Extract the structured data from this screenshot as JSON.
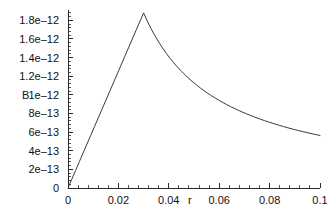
{
  "chart_data": {
    "type": "line",
    "title": "",
    "subtitle": "",
    "xlabel": "r",
    "ylabel": "B",
    "grid": false,
    "legend": null,
    "xlim": [
      0,
      0.1
    ],
    "ylim": [
      0,
      1.9e-12
    ],
    "x_ticks": [
      {
        "value": 0,
        "label": "0"
      },
      {
        "value": 0.02,
        "label": "0.02"
      },
      {
        "value": 0.04,
        "label": "0.04"
      },
      {
        "value": 0.06,
        "label": "0.06"
      },
      {
        "value": 0.08,
        "label": "0.08"
      },
      {
        "value": 0.1,
        "label": "0.1"
      }
    ],
    "y_ticks": [
      {
        "value": 0,
        "label": "0"
      },
      {
        "value": 2e-13,
        "label": "2e–13"
      },
      {
        "value": 4e-13,
        "label": "4e–13"
      },
      {
        "value": 6e-13,
        "label": "6e–13"
      },
      {
        "value": 8e-13,
        "label": "8e–13"
      },
      {
        "value": 1e-12,
        "label": "1e–12"
      },
      {
        "value": 1.2e-12,
        "label": "1.2e–12"
      },
      {
        "value": 1.4e-12,
        "label": "1.4e–12"
      },
      {
        "value": 1.6e-12,
        "label": "1.6e–12"
      },
      {
        "value": 1.8e-12,
        "label": "1.8e–12"
      }
    ],
    "x_minor_ticks_per_interval": 4,
    "y_minor_ticks_per_interval": 4,
    "peak": {
      "x": 0.03,
      "y": 1.88e-12
    },
    "series": [
      {
        "name": "B(r)",
        "color": "#3a3a3a",
        "points": [
          [
            0.0,
            0.0
          ],
          [
            0.0015,
            9.4e-14
          ],
          [
            0.003,
            1.88e-13
          ],
          [
            0.0045,
            2.82e-13
          ],
          [
            0.006,
            3.76e-13
          ],
          [
            0.0075,
            4.7e-13
          ],
          [
            0.009,
            5.64e-13
          ],
          [
            0.0105,
            6.58e-13
          ],
          [
            0.012,
            7.52e-13
          ],
          [
            0.0135,
            8.46e-13
          ],
          [
            0.015,
            9.4e-13
          ],
          [
            0.0165,
            1.034e-12
          ],
          [
            0.018,
            1.128e-12
          ],
          [
            0.0195,
            1.222e-12
          ],
          [
            0.021,
            1.316e-12
          ],
          [
            0.0225,
            1.41e-12
          ],
          [
            0.024,
            1.504e-12
          ],
          [
            0.0255,
            1.598e-12
          ],
          [
            0.027,
            1.692e-12
          ],
          [
            0.0285,
            1.786e-12
          ],
          [
            0.03,
            1.88e-12
          ],
          [
            0.0315,
            1.79e-12
          ],
          [
            0.033,
            1.709e-12
          ],
          [
            0.0345,
            1.635e-12
          ],
          [
            0.036,
            1.567e-12
          ],
          [
            0.0375,
            1.504e-12
          ],
          [
            0.039,
            1.446e-12
          ],
          [
            0.0405,
            1.392e-12
          ],
          [
            0.042,
            1.343e-12
          ],
          [
            0.0435,
            1.297e-12
          ],
          [
            0.045,
            1.253e-12
          ],
          [
            0.0465,
            1.213e-12
          ],
          [
            0.048,
            1.175e-12
          ],
          [
            0.0495,
            1.139e-12
          ],
          [
            0.051,
            1.106e-12
          ],
          [
            0.0525,
            1.074e-12
          ],
          [
            0.054,
            1.044e-12
          ],
          [
            0.0555,
            1.016e-12
          ],
          [
            0.057,
            9.895e-13
          ],
          [
            0.0585,
            9.641e-13
          ],
          [
            0.06,
            9.4e-13
          ],
          [
            0.0615,
            9.171e-13
          ],
          [
            0.063,
            8.952e-13
          ],
          [
            0.0645,
            8.744e-13
          ],
          [
            0.066,
            8.545e-13
          ],
          [
            0.0675,
            8.356e-13
          ],
          [
            0.069,
            8.174e-13
          ],
          [
            0.0705,
            8e-13
          ],
          [
            0.072,
            7.833e-13
          ],
          [
            0.0735,
            7.673e-13
          ],
          [
            0.075,
            7.52e-13
          ],
          [
            0.0765,
            7.373e-13
          ],
          [
            0.078,
            7.231e-13
          ],
          [
            0.0795,
            7.094e-13
          ],
          [
            0.081,
            6.963e-13
          ],
          [
            0.0825,
            6.836e-13
          ],
          [
            0.084,
            6.714e-13
          ],
          [
            0.0855,
            6.596e-13
          ],
          [
            0.087,
            6.483e-13
          ],
          [
            0.0885,
            6.373e-13
          ],
          [
            0.09,
            6.267e-13
          ],
          [
            0.0915,
            6.164e-13
          ],
          [
            0.093,
            6.065e-13
          ],
          [
            0.0945,
            5.968e-13
          ],
          [
            0.096,
            5.875e-13
          ],
          [
            0.0975,
            5.785e-13
          ],
          [
            0.099,
            5.697e-13
          ],
          [
            0.1,
            5.64e-13
          ]
        ]
      }
    ]
  },
  "axes": {
    "y_axis_title": "B",
    "x_axis_title": "r"
  }
}
